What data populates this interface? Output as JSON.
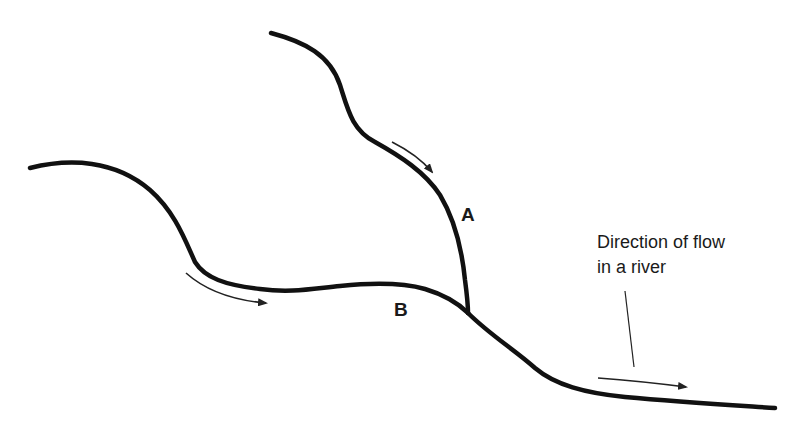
{
  "diagram": {
    "type": "river-confluence",
    "colors": {
      "background": "#ffffff",
      "river": "#111111",
      "arrow": "#222222",
      "text": "#1a1a1a"
    },
    "labels": {
      "tributary_a": "A",
      "tributary_b": "B",
      "caption_line1": "Direction of flow",
      "caption_line2": "in a river"
    },
    "elements": [
      {
        "id": "river-a",
        "description": "Upper tributary flowing from top down to confluence"
      },
      {
        "id": "river-b",
        "description": "Left tributary flowing from left to confluence"
      },
      {
        "id": "main-river",
        "description": "Main channel flowing from confluence to bottom right"
      },
      {
        "id": "arrow-a",
        "description": "Flow direction arrow along tributary A"
      },
      {
        "id": "arrow-b",
        "description": "Flow direction arrow along tributary B"
      },
      {
        "id": "arrow-main",
        "description": "Flow direction arrow along main river"
      },
      {
        "id": "leader-line",
        "description": "Pointer from caption to main river arrow"
      }
    ]
  }
}
